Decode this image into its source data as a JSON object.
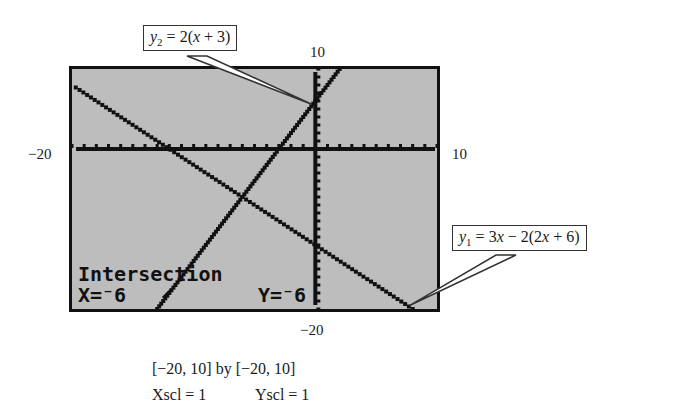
{
  "chart_data": {
    "type": "line",
    "title": "",
    "xlabel": "",
    "ylabel": "",
    "xlim": [
      -20,
      10
    ],
    "ylim": [
      -20,
      10
    ],
    "xscl": 1,
    "yscl": 1,
    "grid": false,
    "axis_labels": {
      "x_min": "−20",
      "x_max": "10",
      "y_min": "−20",
      "y_max": "10"
    },
    "series": [
      {
        "name": "y1",
        "equation": "y1 = 3x − 2(2x + 6)",
        "slope": -1,
        "intercept": -12,
        "x": [
          -20,
          8
        ],
        "y": [
          8,
          -20
        ]
      },
      {
        "name": "y2",
        "equation": "y2 = 2(x + 3)",
        "slope": 2,
        "intercept": 6,
        "x": [
          -13,
          2
        ],
        "y": [
          -20,
          10
        ]
      }
    ],
    "annotations": [
      {
        "text": "Intersection",
        "x": -6,
        "y": -6
      }
    ],
    "intersection": {
      "x": -6,
      "y": -6
    }
  },
  "labels": {
    "top": "10",
    "bottom": "−20",
    "left": "−20",
    "right": "10"
  },
  "callouts": {
    "y2": {
      "var": "y",
      "sub": "2",
      "rest": " = 2(",
      "x": "x",
      "tail": " + 3)"
    },
    "y1": {
      "var": "y",
      "sub": "1",
      "rest": " = 3",
      "x": "x",
      "mid": " − 2(2",
      "x2": "x",
      "tail": " + 6)"
    }
  },
  "calculator": {
    "mode_text": "Intersection",
    "x_readout": "X=⁻6",
    "y_readout": "Y=⁻6"
  },
  "caption": {
    "window": "[−20, 10] by [−20, 10]",
    "xscl": "Xscl = 1",
    "yscl": "Yscl = 1"
  }
}
